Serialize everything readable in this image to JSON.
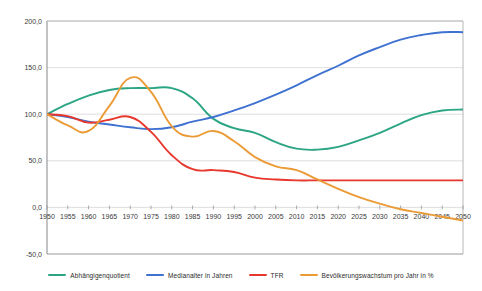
{
  "chart_data": {
    "type": "line",
    "title": "",
    "xlabel": "",
    "ylabel": "",
    "xlim": [
      1950,
      2050
    ],
    "ylim": [
      -50,
      200
    ],
    "grid": true,
    "legend_position": "bottom",
    "y_ticks": [
      "200,0",
      "150,0",
      "100,0",
      "50,0",
      "0,0",
      "-50,0"
    ],
    "y_tick_values": [
      200,
      150,
      100,
      50,
      0,
      -50
    ],
    "x_ticks": [
      "1950",
      "1955",
      "1960",
      "1965",
      "1970",
      "1975",
      "1980",
      "1985",
      "1990",
      "1995",
      "2000",
      "2005",
      "2010",
      "2015",
      "2020",
      "2025",
      "2030",
      "2035",
      "2040",
      "2045",
      "2050"
    ],
    "x": [
      1950,
      1955,
      1960,
      1965,
      1970,
      1975,
      1980,
      1985,
      1990,
      1995,
      2000,
      2005,
      2010,
      2015,
      2020,
      2025,
      2030,
      2035,
      2040,
      2045,
      2050
    ],
    "series": [
      {
        "name": "Abhängigenquotient",
        "color": "#2ca584",
        "values": [
          100,
          111,
          120,
          126,
          128,
          128,
          128,
          117,
          95,
          85,
          80,
          70,
          63,
          62,
          65,
          72,
          80,
          90,
          99,
          104,
          105
        ]
      },
      {
        "name": "Medianalter in Jahren",
        "color": "#3f72d0",
        "values": [
          100,
          97,
          92,
          89,
          86,
          84,
          86,
          92,
          97,
          104,
          112,
          121,
          131,
          142,
          152,
          163,
          172,
          180,
          185,
          188,
          188
        ]
      },
      {
        "name": "TFR",
        "color": "#e8372c",
        "values": [
          100,
          98,
          91,
          94,
          97,
          81,
          56,
          41,
          40,
          38,
          32,
          30,
          29,
          29,
          29,
          29,
          29,
          29,
          29,
          29,
          29
        ]
      },
      {
        "name": "Bevölkerungswachstum pro Jahr in %",
        "color": "#eb9b36",
        "values": [
          100,
          88,
          82,
          109,
          139,
          124,
          87,
          76,
          82,
          71,
          54,
          44,
          40,
          30,
          20,
          11,
          4,
          -2,
          -6,
          -10,
          -14
        ]
      }
    ]
  },
  "legend": {
    "items": [
      {
        "label": "Abhängigenquotient",
        "color": "#2ca584"
      },
      {
        "label": "Medianalter in Jahren",
        "color": "#3f72d0"
      },
      {
        "label": "TFR",
        "color": "#e8372c"
      },
      {
        "label": "Bevölkerungswachstum pro Jahr in %",
        "color": "#eb9b36"
      }
    ]
  }
}
